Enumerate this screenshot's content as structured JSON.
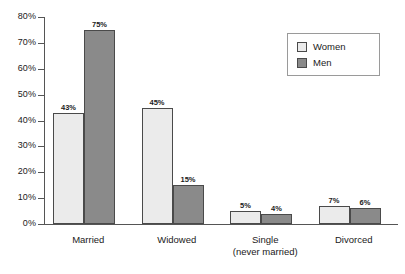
{
  "chart_data": {
    "type": "bar",
    "title": "",
    "subtitle": "",
    "xlabel": "",
    "ylabel": "",
    "ylim": [
      0,
      80
    ],
    "grid": false,
    "legend_position": "top-right",
    "categories": [
      "Married",
      "Widowed",
      "Single",
      "Divorced"
    ],
    "category_sublabels": [
      "",
      "",
      "(never married)",
      ""
    ],
    "ytick_labels": [
      "80%",
      "70%",
      "60%",
      "50%",
      "40%",
      "30%",
      "20%",
      "10%",
      "0%"
    ],
    "ytick_values": [
      80,
      70,
      60,
      50,
      40,
      30,
      20,
      10,
      0
    ],
    "series": [
      {
        "name": "Women",
        "color": "#ebebeb",
        "values": [
          43,
          45,
          5,
          7
        ],
        "value_labels": [
          "43%",
          "45%",
          "5%",
          "7%"
        ]
      },
      {
        "name": "Men",
        "color": "#8a8a8a",
        "values": [
          75,
          15,
          4,
          6
        ],
        "value_labels": [
          "75%",
          "15%",
          "4%",
          "6%"
        ]
      }
    ]
  },
  "legend": {
    "items": [
      {
        "label": "Women",
        "color": "#ebebeb"
      },
      {
        "label": "Men",
        "color": "#8a8a8a"
      }
    ]
  },
  "colors": {
    "women": "#ebebeb",
    "men": "#8a8a8a",
    "axis": "#555555",
    "bar_outline": "#4a4a4a",
    "text": "#1a1a1a",
    "background": "#ffffff"
  }
}
